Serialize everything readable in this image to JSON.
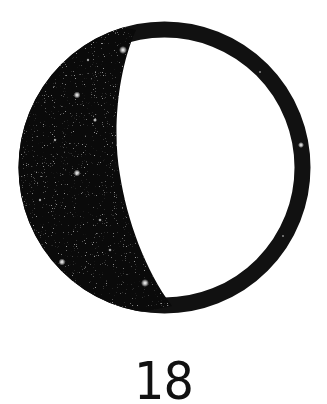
{
  "figure": {
    "type": "moon-phase",
    "phase_description": "waning gibbous",
    "label": "18",
    "colors": {
      "background": "#ffffff",
      "shadow": "#0a0a0a",
      "ring": "#111111",
      "stars": "#ffffff"
    }
  }
}
